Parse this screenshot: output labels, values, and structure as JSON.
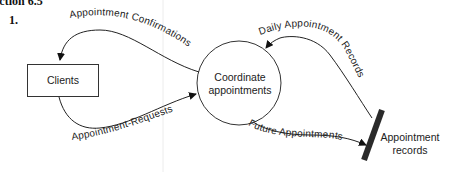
{
  "heading": "ection 6.5",
  "item_number": "1.",
  "diagram": {
    "external_entity": {
      "label": "Clients"
    },
    "process": {
      "label_line1": "Coordinate",
      "label_line2": "appointments"
    },
    "data_store": {
      "label_line1": "Appointment",
      "label_line2": "records"
    },
    "flows": {
      "confirmations": "Appointment Confirmations",
      "requests": "Appointment-Requests",
      "daily_records": "Daily Appointment Records",
      "future": "Future Appointments"
    }
  }
}
